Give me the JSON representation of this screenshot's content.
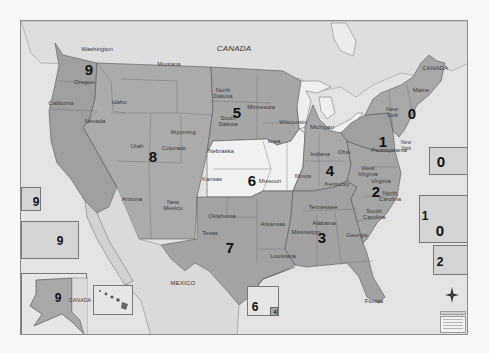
{
  "map": {
    "title": "",
    "region_fill_default": "#a9a9a9",
    "region_fill_light": "#f1f1f1",
    "water_color": "#e3e3e3",
    "labels": {
      "canada_top": "CANADA",
      "canada_ne": "CANADA",
      "canada_alaska": "CANADA",
      "mexico": "MEXICO"
    },
    "states": {
      "washington": "Washington",
      "oregon": "Oregon",
      "california": "California",
      "idaho": "Idaho",
      "nevada": "Nevada",
      "montana": "Montana",
      "wyoming": "Wyoming",
      "utah": "Utah",
      "colorado": "Colorado",
      "arizona": "Arizona",
      "new_mexico": "New\nMexico",
      "north_dakota": "North\nDakota",
      "south_dakota": "South\nDakota",
      "minnesota": "Minnesota",
      "iowa": "Iowa",
      "wisconsin": "Wisconsin",
      "nebraska": "Nebraska",
      "kansas": "Kansas",
      "missouri": "Missouri",
      "illinois": "Illinois",
      "oklahoma": "Oklahoma",
      "texas": "Texas",
      "arkansas": "Arkansas",
      "louisiana": "Louisiana",
      "mississippi": "Mississippi",
      "alabama": "Alabama",
      "tennessee": "Tennessee",
      "georgia": "Georgia",
      "florida": "Florida",
      "south_carolina": "South\nCarolina",
      "north_carolina": "North\nCarolina",
      "virginia": "Virginia",
      "west_virginia": "West\nVirginia",
      "kentucky": "Kentucky",
      "ohio": "Ohio",
      "indiana": "Indiana",
      "michigan": "Michigan",
      "pennsylvania": "Pennsylvania",
      "new_york": "New\nYork",
      "new_york_city": "New\nYork",
      "maine": "Maine"
    },
    "zones": {
      "z9_main": "9",
      "z8": "8",
      "z5": "5",
      "z6": "6",
      "z7": "7",
      "z4": "4",
      "z3": "3",
      "z2": "2",
      "z1": "1",
      "z0": "0"
    },
    "insets": [
      {
        "id": "inset-socal",
        "zone": "9"
      },
      {
        "id": "inset-la",
        "zone": "9"
      },
      {
        "id": "inset-alaska",
        "zone": "9"
      },
      {
        "id": "inset-hawaii",
        "zone": ""
      },
      {
        "id": "inset-kansas-city",
        "zone": "6",
        "secondary_zone": "4"
      },
      {
        "id": "inset-boston",
        "zone": "0"
      },
      {
        "id": "inset-nyc",
        "zone": "0",
        "secondary_zone": "1"
      },
      {
        "id": "inset-dc",
        "zone": "2"
      }
    ]
  }
}
